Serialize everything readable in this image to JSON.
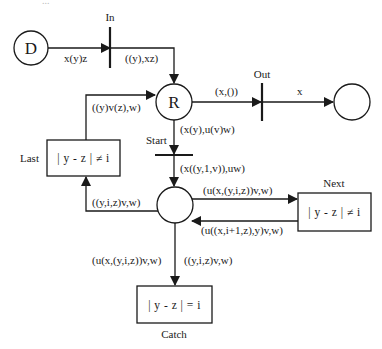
{
  "diagram": {
    "type": "petri-net",
    "top_cutoff_text": "...",
    "places": {
      "d": {
        "label": "D"
      },
      "r": {
        "label": "R"
      },
      "out_place": {
        "label": ""
      },
      "loop_place": {
        "label": ""
      }
    },
    "transitions": {
      "in": {
        "label": "In"
      },
      "out": {
        "label": "Out"
      },
      "start": {
        "label": "Start"
      },
      "last": {
        "label": "Last",
        "guard": "| y - z | ≠ i"
      },
      "next": {
        "label": "Next",
        "guard": "| y - z | ≠ i"
      },
      "catch": {
        "label": "Catch",
        "guard": "| y - z | = i"
      }
    },
    "arcs": {
      "d_to_in": "x(y)z",
      "in_to_r": "((y),xz)",
      "r_to_out": "(x,())",
      "out_to_place": "x",
      "last_to_r": "((y)v(z),w)",
      "r_to_start": "(x(y),u(v)w)",
      "start_to_loop": "(x((y,1,v)),uw)",
      "loop_to_last": "((y,i,z)v,w)",
      "loop_to_next": "(u(x,(y,i,z))v,w)",
      "next_to_loop": "(u((x,i+1,z),y)v,w)",
      "loop_to_catch": "(u(x,(y,i,z))v,w)",
      "catch_out": "((y,i,z)v,w)"
    },
    "colors": {
      "ink": "#1a1a1a",
      "background": "#ffffff"
    }
  }
}
